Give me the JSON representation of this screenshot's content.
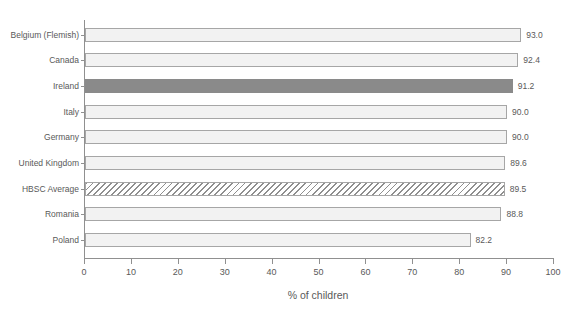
{
  "chart_data": {
    "type": "bar",
    "orientation": "horizontal",
    "title": "",
    "xlabel": "% of children",
    "xlim": [
      0,
      100
    ],
    "xticks": [
      "0",
      "10",
      "20",
      "30",
      "40",
      "50",
      "60",
      "70",
      "80",
      "90",
      "100"
    ],
    "grid": false,
    "legend": "none",
    "categories": [
      "Belgium (Flemish)",
      "Canada",
      "Ireland",
      "Italy",
      "Germany",
      "United Kingdom",
      "HBSC Average",
      "Romania",
      "Poland"
    ],
    "values": [
      93.0,
      92.4,
      91.2,
      90.0,
      90.0,
      89.6,
      89.5,
      88.8,
      82.2
    ],
    "value_labels": [
      "93.0",
      "92.4",
      "91.2",
      "90.0",
      "90.0",
      "89.6",
      "89.5",
      "88.8",
      "82.2"
    ],
    "bar_styles": [
      "plain",
      "plain",
      "solid",
      "plain",
      "plain",
      "plain",
      "hatch",
      "plain",
      "plain"
    ],
    "highlighted_category": "Ireland",
    "hatched_category": "HBSC Average",
    "colors": {
      "bar_fill": "#f2f2f2",
      "bar_border": "#a6a6a6",
      "highlight_fill": "#8a8a8a",
      "hatch_stripe": "#8f8f8f",
      "axis": "#909090",
      "text": "#595959"
    }
  }
}
